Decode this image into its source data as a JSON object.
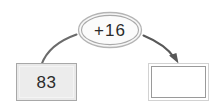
{
  "diagram": {
    "kind": "arrow-flow-number-machine",
    "background_color": "#ffffff",
    "stroke_color": "#6b6b6b",
    "input": {
      "label": "83",
      "fill_color": "#ececec",
      "border_color": "#a8a8a8"
    },
    "operation": {
      "label": "+16",
      "fill_color": "#f7f7f7",
      "border_color": "#b4b4b4"
    },
    "output": {
      "label": "",
      "fill_color": "#ffffff",
      "border_color": "#9a9a9a"
    },
    "arrows": [
      {
        "name": "input-to-operation",
        "from": "input",
        "to": "operation",
        "has_arrowhead": false
      },
      {
        "name": "operation-to-output",
        "from": "operation",
        "to": "output",
        "has_arrowhead": true
      }
    ]
  }
}
